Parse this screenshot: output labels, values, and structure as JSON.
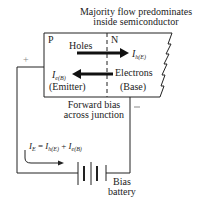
{
  "diagram": {
    "title_line1": "Majority flow predominates",
    "title_line2": "inside semiconductor",
    "regions": {
      "p": "P",
      "n": "N"
    },
    "holes_label": "Holes",
    "holes_current": {
      "symbol": "I",
      "subscript": "h(E)"
    },
    "electrons_label": "Electrons",
    "electrons_current": {
      "symbol": "I",
      "subscript": "e(B)"
    },
    "emitter_label": "(Emitter)",
    "base_label": "(Base)",
    "bias_line1": "Forward bias",
    "bias_line2": "across junction",
    "plus_sign": "+",
    "minus_sign": "−",
    "equation": {
      "lhs": "I",
      "lhs_sub": "E",
      "eq": " = ",
      "t1": "I",
      "t1_sub": "h(E)",
      "plus": " + ",
      "t2": "I",
      "t2_sub": "e(B)"
    },
    "battery_line1": "Bias",
    "battery_line2": "battery",
    "colors": {
      "ink": "#222222",
      "background": "#ffffff"
    }
  }
}
